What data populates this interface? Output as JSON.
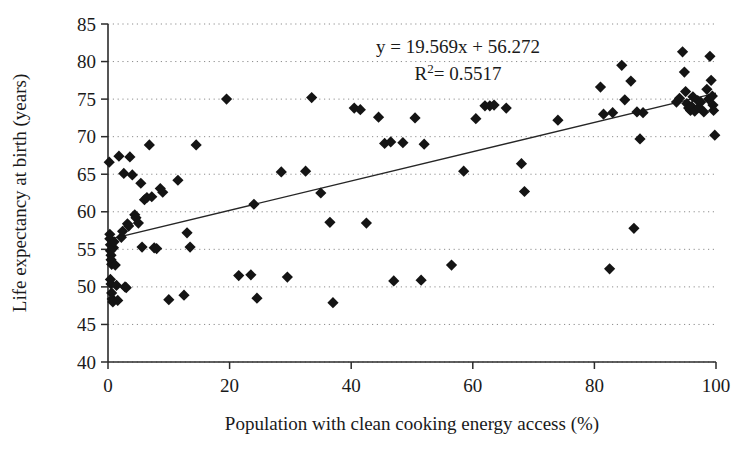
{
  "chart_data": {
    "type": "scatter",
    "title": "",
    "xlabel": "Population with clean cooking energy access (%)",
    "ylabel": "Life expectancy at birth (years)",
    "xlim": [
      0,
      100
    ],
    "ylim": [
      40,
      85
    ],
    "xticks": [
      0,
      20,
      40,
      60,
      80,
      100
    ],
    "yticks": [
      40,
      45,
      50,
      55,
      60,
      65,
      70,
      75,
      80,
      85
    ],
    "grid": "horizontal-dotted",
    "legend": "none",
    "marker": "filled-diamond",
    "marker_color": "#141414",
    "annotations": {
      "equation": "y = 19.569x + 56.272",
      "r_squared_label": "R",
      "r_squared_sup": "2",
      "r_squared_value": "= 0.5517",
      "r_squared_full": "R2 = 0.5517"
    },
    "trendline": {
      "type": "linear",
      "slope": 0.19569,
      "intercept": 56.272,
      "x_start": 0,
      "x_end": 100,
      "y_start": 56.3,
      "y_end": 75.8,
      "color": "#262626",
      "note": "Displayed equation uses x in fraction units: y = 19.569x + 56.272"
    },
    "points": [
      [
        0.2,
        66.6
      ],
      [
        0.3,
        57.0
      ],
      [
        0.3,
        56.4
      ],
      [
        0.4,
        55.6
      ],
      [
        0.4,
        54.8
      ],
      [
        0.5,
        54.2
      ],
      [
        0.5,
        53.6
      ],
      [
        0.6,
        53.0
      ],
      [
        0.4,
        51.0
      ],
      [
        0.5,
        50.4
      ],
      [
        0.6,
        49.2
      ],
      [
        0.7,
        48.4
      ],
      [
        0.8,
        48.0
      ],
      [
        0.9,
        55.2
      ],
      [
        1.0,
        56.0
      ],
      [
        1.2,
        52.9
      ],
      [
        1.4,
        50.2
      ],
      [
        1.6,
        48.2
      ],
      [
        1.8,
        67.4
      ],
      [
        2.2,
        56.6
      ],
      [
        2.4,
        57.4
      ],
      [
        2.6,
        65.1
      ],
      [
        2.8,
        50.0
      ],
      [
        3.0,
        49.9
      ],
      [
        3.2,
        58.4
      ],
      [
        3.4,
        58.1
      ],
      [
        3.6,
        67.3
      ],
      [
        4.0,
        64.9
      ],
      [
        4.4,
        59.6
      ],
      [
        4.6,
        59.2
      ],
      [
        5.0,
        58.5
      ],
      [
        5.4,
        63.8
      ],
      [
        5.6,
        55.3
      ],
      [
        6.0,
        61.6
      ],
      [
        6.4,
        61.9
      ],
      [
        6.8,
        68.9
      ],
      [
        7.2,
        62.0
      ],
      [
        7.6,
        55.2
      ],
      [
        8.0,
        55.1
      ],
      [
        8.6,
        63.1
      ],
      [
        9.0,
        62.6
      ],
      [
        10.0,
        48.3
      ],
      [
        11.5,
        64.2
      ],
      [
        12.5,
        48.9
      ],
      [
        13.0,
        57.2
      ],
      [
        13.5,
        55.3
      ],
      [
        14.5,
        68.9
      ],
      [
        19.5,
        75.0
      ],
      [
        21.5,
        51.5
      ],
      [
        23.5,
        51.6
      ],
      [
        24.0,
        61.0
      ],
      [
        24.5,
        48.5
      ],
      [
        28.5,
        65.3
      ],
      [
        29.5,
        51.3
      ],
      [
        32.5,
        65.4
      ],
      [
        33.5,
        75.2
      ],
      [
        35.0,
        62.5
      ],
      [
        36.5,
        58.6
      ],
      [
        37.0,
        47.9
      ],
      [
        40.5,
        73.8
      ],
      [
        41.5,
        73.6
      ],
      [
        42.5,
        58.5
      ],
      [
        44.5,
        72.6
      ],
      [
        45.5,
        69.1
      ],
      [
        46.5,
        69.3
      ],
      [
        47.0,
        50.8
      ],
      [
        48.5,
        69.2
      ],
      [
        50.5,
        72.5
      ],
      [
        51.5,
        50.9
      ],
      [
        52.0,
        69.0
      ],
      [
        56.5,
        52.9
      ],
      [
        58.5,
        65.4
      ],
      [
        60.5,
        72.4
      ],
      [
        62.0,
        74.1
      ],
      [
        62.8,
        74.1
      ],
      [
        63.5,
        74.2
      ],
      [
        65.5,
        73.8
      ],
      [
        68.0,
        66.4
      ],
      [
        68.5,
        62.7
      ],
      [
        74.0,
        72.2
      ],
      [
        81.0,
        76.6
      ],
      [
        81.5,
        73.0
      ],
      [
        82.5,
        52.4
      ],
      [
        83.0,
        73.2
      ],
      [
        84.5,
        79.5
      ],
      [
        85.0,
        74.9
      ],
      [
        86.0,
        77.4
      ],
      [
        86.5,
        57.8
      ],
      [
        87.0,
        73.3
      ],
      [
        87.5,
        69.7
      ],
      [
        88.0,
        73.2
      ],
      [
        93.5,
        74.6
      ],
      [
        94.0,
        75.1
      ],
      [
        94.5,
        81.3
      ],
      [
        94.8,
        78.6
      ],
      [
        95.0,
        76.0
      ],
      [
        95.2,
        74.4
      ],
      [
        95.5,
        73.8
      ],
      [
        95.8,
        73.5
      ],
      [
        96.0,
        74.0
      ],
      [
        96.2,
        75.3
      ],
      [
        96.5,
        73.4
      ],
      [
        97.0,
        74.8
      ],
      [
        97.2,
        73.9
      ],
      [
        97.5,
        74.6
      ],
      [
        98.0,
        73.3
      ],
      [
        98.5,
        76.3
      ],
      [
        98.8,
        75.0
      ],
      [
        99.0,
        80.7
      ],
      [
        99.2,
        77.5
      ],
      [
        99.4,
        75.4
      ],
      [
        99.5,
        74.2
      ],
      [
        99.6,
        73.5
      ],
      [
        99.8,
        70.2
      ]
    ]
  }
}
